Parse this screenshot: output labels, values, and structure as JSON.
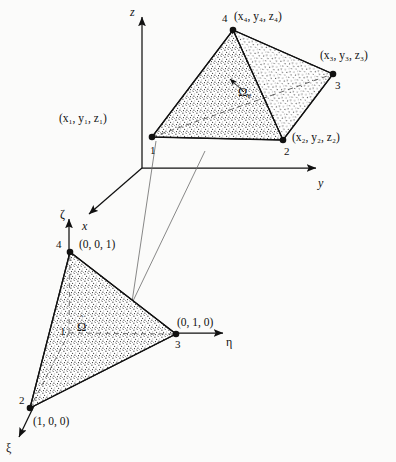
{
  "figure": {
    "kind": "finite-element-mapping-diagram"
  },
  "physical_element": {
    "domain_label": "Ω",
    "domain_subscript": "e",
    "nodes": [
      {
        "number": "1",
        "coords": "(x₁, y₁, z₁)"
      },
      {
        "number": "2",
        "coords": "(x₂, y₂, z₂)"
      },
      {
        "number": "3",
        "coords": "(x₃, y₃, z₃)"
      },
      {
        "number": "4",
        "coords": "(x₄, y₄, z₄)"
      }
    ],
    "axes": [
      {
        "name": "z",
        "label": "z"
      },
      {
        "name": "y",
        "label": "y"
      },
      {
        "name": "x",
        "label": "x"
      }
    ]
  },
  "master_element": {
    "domain_label": "Ω",
    "domain_accent": "ˆ",
    "nodes": [
      {
        "number": "1",
        "coords": ""
      },
      {
        "number": "2",
        "coords": "(1, 0, 0)"
      },
      {
        "number": "3",
        "coords": "(0, 1, 0)"
      },
      {
        "number": "4",
        "coords": "(0, 0, 1)"
      }
    ],
    "axes": [
      {
        "name": "zeta",
        "label": "ζ"
      },
      {
        "name": "eta",
        "label": "η"
      },
      {
        "name": "xi",
        "label": "ξ"
      }
    ]
  },
  "colors": {
    "ink": "#111111",
    "paper": "#fbfbfa",
    "stipple": "#2b2b2b"
  }
}
